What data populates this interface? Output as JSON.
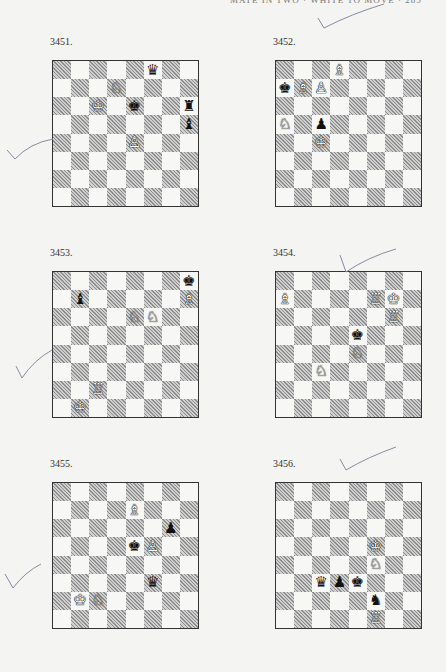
{
  "page": {
    "header": "MATE IN TWO · WHITE TO MOVE · 285"
  },
  "glyphs": {
    "wK": "♔",
    "wQ": "♕",
    "wR": "♖",
    "wB": "♗",
    "wN": "♘",
    "wP": "♙",
    "bK": "♚",
    "bQ": "♛",
    "bR": "♜",
    "bB": "♝",
    "bN": "♞",
    "bP": "♟"
  },
  "puzzles": [
    {
      "number": "3451.",
      "pieces": [
        {
          "sq": "f8",
          "p": "bQ"
        },
        {
          "sq": "d7",
          "p": "wN"
        },
        {
          "sq": "c6",
          "p": "wK"
        },
        {
          "sq": "e6",
          "p": "bK"
        },
        {
          "sq": "h6",
          "p": "bR"
        },
        {
          "sq": "h5",
          "p": "bB"
        },
        {
          "sq": "e4",
          "p": "wP"
        }
      ]
    },
    {
      "number": "3452.",
      "pieces": [
        {
          "sq": "d8",
          "p": "wB"
        },
        {
          "sq": "a7",
          "p": "bK"
        },
        {
          "sq": "b7",
          "p": "wB"
        },
        {
          "sq": "c7",
          "p": "wP"
        },
        {
          "sq": "a5",
          "p": "wN"
        },
        {
          "sq": "c5",
          "p": "bP"
        },
        {
          "sq": "c4",
          "p": "wK"
        }
      ]
    },
    {
      "number": "3453.",
      "pieces": [
        {
          "sq": "h8",
          "p": "bK"
        },
        {
          "sq": "b7",
          "p": "bB"
        },
        {
          "sq": "h7",
          "p": "wB"
        },
        {
          "sq": "e6",
          "p": "wN"
        },
        {
          "sq": "f6",
          "p": "wN"
        },
        {
          "sq": "c2",
          "p": "wR"
        },
        {
          "sq": "b1",
          "p": "wK"
        }
      ]
    },
    {
      "number": "3454.",
      "pieces": [
        {
          "sq": "a7",
          "p": "wB"
        },
        {
          "sq": "f7",
          "p": "wR"
        },
        {
          "sq": "g7",
          "p": "wK"
        },
        {
          "sq": "g6",
          "p": "wR"
        },
        {
          "sq": "e5",
          "p": "bK"
        },
        {
          "sq": "e4",
          "p": "wN"
        },
        {
          "sq": "c3",
          "p": "wN"
        }
      ]
    },
    {
      "number": "3455.",
      "pieces": [
        {
          "sq": "e7",
          "p": "wB"
        },
        {
          "sq": "g6",
          "p": "bP"
        },
        {
          "sq": "e5",
          "p": "bK"
        },
        {
          "sq": "f5",
          "p": "wP"
        },
        {
          "sq": "f3",
          "p": "bQ"
        },
        {
          "sq": "b2",
          "p": "wK"
        },
        {
          "sq": "c2",
          "p": "wN"
        }
      ]
    },
    {
      "number": "3456.",
      "pieces": [
        {
          "sq": "f5",
          "p": "wK"
        },
        {
          "sq": "f4",
          "p": "wN"
        },
        {
          "sq": "c3",
          "p": "bQ"
        },
        {
          "sq": "d3",
          "p": "bP"
        },
        {
          "sq": "e3",
          "p": "bK"
        },
        {
          "sq": "f2",
          "p": "bN"
        },
        {
          "sq": "f1",
          "p": "wR"
        }
      ]
    }
  ]
}
